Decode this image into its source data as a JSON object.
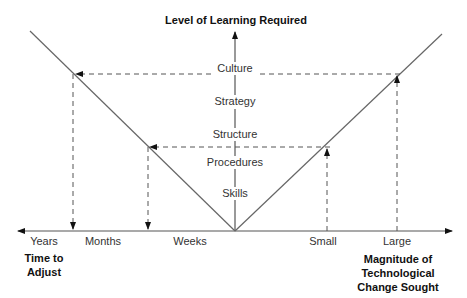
{
  "diagram": {
    "y_axis_title": "Level of Learning Required",
    "levels": [
      "Culture",
      "Strategy",
      "Structure",
      "Procedures",
      "Skills"
    ],
    "x_axis_left": {
      "ticks": [
        "Years",
        "Months",
        "Weeks"
      ],
      "title_line1": "Time to",
      "title_line2": "Adjust"
    },
    "x_axis_right": {
      "ticks": [
        "Small",
        "Large"
      ],
      "title_line1": "Magnitude of",
      "title_line2": "Technological",
      "title_line3": "Change Sought"
    }
  }
}
